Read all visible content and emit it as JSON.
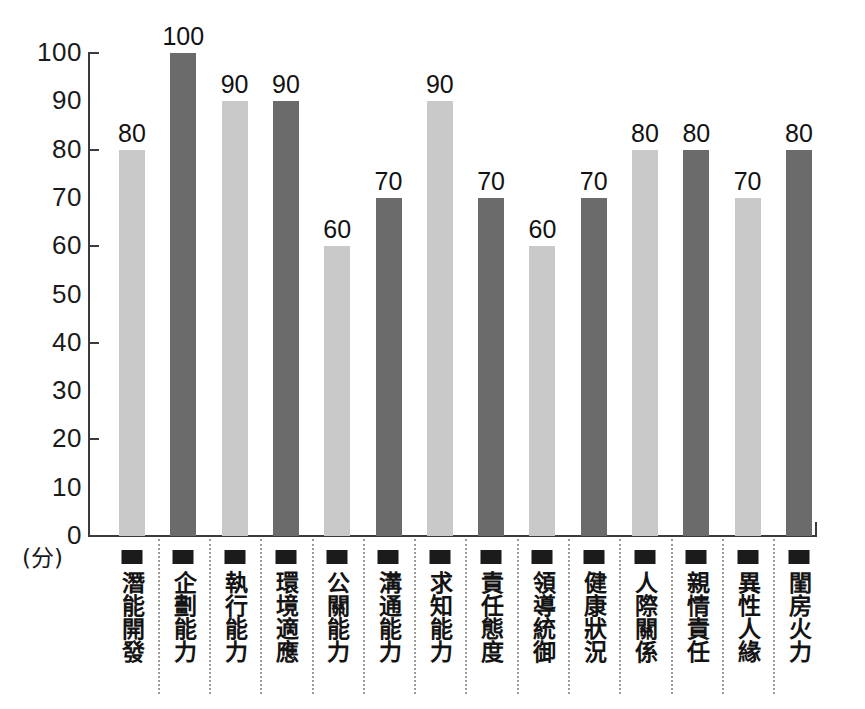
{
  "chart_data": {
    "type": "bar",
    "title": "",
    "xlabel": "",
    "ylabel": "(分)",
    "ylim": [
      0,
      100
    ],
    "ytick_step": 10,
    "ytick_mark_step": 20,
    "grid": false,
    "legend": "none",
    "categories": [
      "潛能開發",
      "企劃能力",
      "執行能力",
      "環境適應",
      "公關能力",
      "溝通能力",
      "求知能力",
      "責任態度",
      "領導統御",
      "健康狀況",
      "人際關係",
      "親情責任",
      "異性人緣",
      "閨房火力"
    ],
    "values": [
      80,
      100,
      90,
      90,
      60,
      70,
      90,
      70,
      60,
      70,
      80,
      80,
      70,
      80
    ],
    "bar_shades": [
      "light",
      "dark",
      "light",
      "dark",
      "light",
      "dark",
      "light",
      "dark",
      "light",
      "dark",
      "light",
      "dark",
      "light",
      "dark"
    ],
    "ytick_labels": [
      "100",
      "90",
      "80",
      "70",
      "60",
      "50",
      "40",
      "30",
      "20",
      "10",
      "0"
    ],
    "ytick_values": [
      100,
      90,
      80,
      70,
      60,
      50,
      40,
      30,
      20,
      10,
      0
    ],
    "ytick_marked": [
      true,
      false,
      true,
      false,
      true,
      false,
      true,
      false,
      true,
      false,
      false
    ],
    "colors": {
      "light_bar": "#c9c9c9",
      "dark_bar": "#6b6b6b",
      "axis": "#3b3b3b",
      "text": "#121212",
      "separator": "#9a9a9a",
      "background": "#ffffff"
    }
  }
}
